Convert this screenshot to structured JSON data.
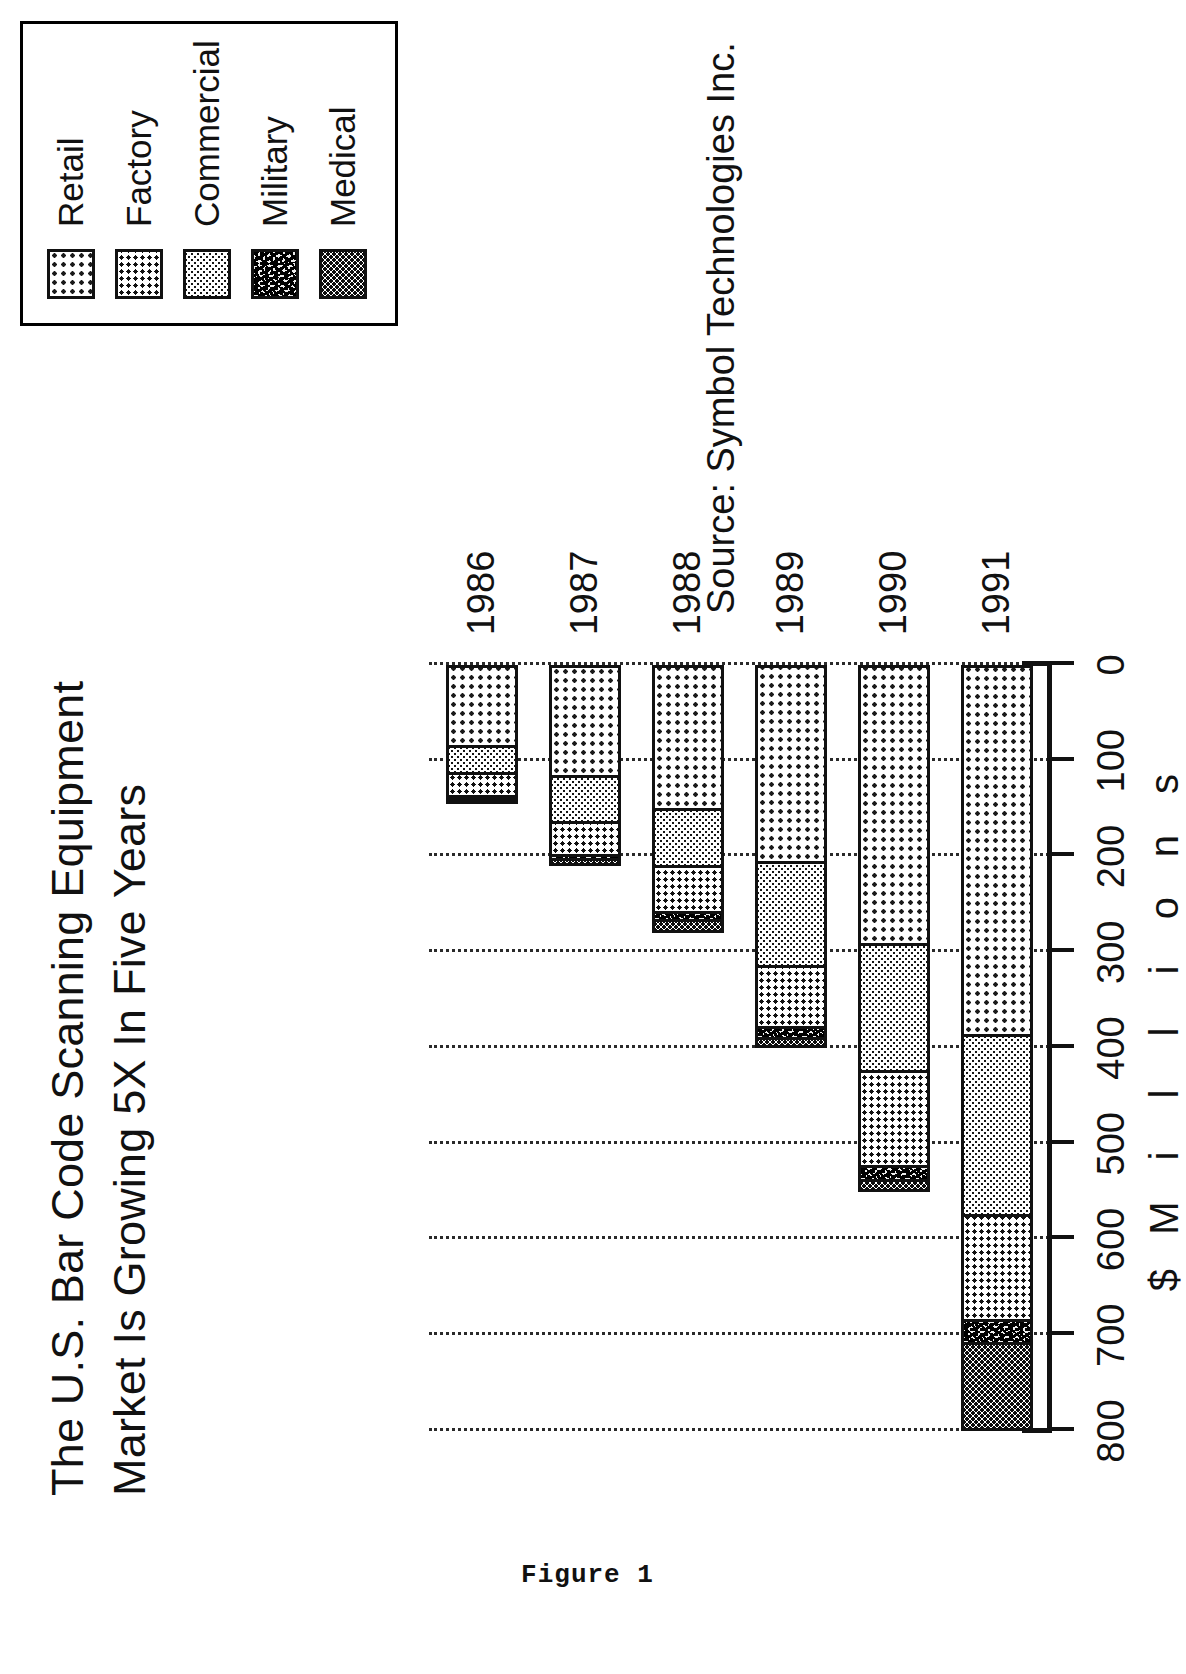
{
  "figure_caption": "Figure 1",
  "title": {
    "line1": "The U.S. Bar Code Scanning Equipment",
    "line2": "Market Is Growing 5X In Five Years"
  },
  "source": "Source: Symbol Technologies Inc.",
  "axis_title_letters": [
    "$",
    "M",
    "i",
    "l",
    "l",
    "i",
    "o",
    "n",
    "s"
  ],
  "legend": {
    "items": [
      {
        "label": "Retail",
        "pattern": "p-retail"
      },
      {
        "label": "Factory",
        "pattern": "p-factory"
      },
      {
        "label": "Commercial",
        "pattern": "p-commercial"
      },
      {
        "label": "Military",
        "pattern": "p-military"
      },
      {
        "label": "Medical",
        "pattern": "p-medical"
      }
    ]
  },
  "chart_data": {
    "type": "bar",
    "orientation": "vertical-stacked",
    "title": "The U.S. Bar Code Scanning Equipment Market Is Growing 5X In Five Years",
    "xlabel": "",
    "ylabel": "$ Millions",
    "ylim": [
      0,
      800
    ],
    "yticks": [
      0,
      100,
      200,
      300,
      400,
      500,
      600,
      700,
      800
    ],
    "grid": true,
    "legend_position": "top-right",
    "categories": [
      "1986",
      "1987",
      "1988",
      "1989",
      "1990",
      "1991"
    ],
    "series": [
      {
        "name": "Retail",
        "values": [
          85,
          115,
          150,
          205,
          290,
          385
        ]
      },
      {
        "name": "Factory",
        "values": [
          25,
          35,
          50,
          65,
          100,
          110
        ]
      },
      {
        "name": "Commercial",
        "values": [
          30,
          50,
          60,
          110,
          135,
          190
        ]
      },
      {
        "name": "Military",
        "values": [
          2,
          4,
          8,
          12,
          15,
          25
        ]
      },
      {
        "name": "Medical",
        "values": [
          3,
          6,
          12,
          8,
          10,
          90
        ]
      }
    ],
    "totals": [
      145,
      210,
      280,
      400,
      550,
      800
    ],
    "units": "millions of dollars"
  }
}
